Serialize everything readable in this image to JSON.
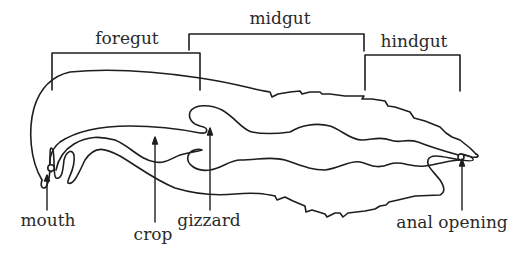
{
  "diagram": {
    "regions": [
      {
        "id": "foregut",
        "label": "foregut"
      },
      {
        "id": "midgut",
        "label": "midgut"
      },
      {
        "id": "hindgut",
        "label": "hindgut"
      }
    ],
    "parts": [
      {
        "id": "mouth",
        "label": "mouth"
      },
      {
        "id": "crop",
        "label": "crop"
      },
      {
        "id": "gizzard",
        "label": "gizzard"
      },
      {
        "id": "anal_opening",
        "label": "anal opening"
      }
    ],
    "colors": {
      "line": "#1e1e1e",
      "background": "#ffffff"
    }
  }
}
